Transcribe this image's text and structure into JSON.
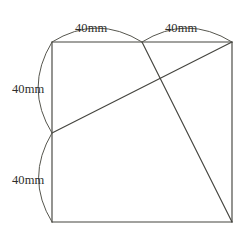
{
  "figure": {
    "type": "geometry-diagram",
    "canvas": {
      "width": 248,
      "height": 238
    },
    "colors": {
      "background": "#ffffff",
      "stroke": "#45453f",
      "arc_stroke": "#56564e",
      "label_text": "#2d2d2b"
    },
    "vertices": {
      "top_left": {
        "x": 52,
        "y": 42
      },
      "top_mid": {
        "x": 142,
        "y": 42
      },
      "top_right": {
        "x": 232,
        "y": 42
      },
      "left_mid": {
        "x": 52,
        "y": 133
      },
      "bottom_left": {
        "x": 52,
        "y": 222
      },
      "bottom_right": {
        "x": 232,
        "y": 222
      }
    },
    "outline": [
      {
        "name": "top-edge",
        "from": "top_left",
        "to": "top_right"
      },
      {
        "name": "right-edge",
        "from": "top_right",
        "to": "bottom_right"
      },
      {
        "name": "bottom-edge",
        "from": "bottom_right",
        "to": "bottom_left"
      },
      {
        "name": "left-edge",
        "from": "bottom_left",
        "to": "top_left"
      }
    ],
    "diagonals": [
      {
        "name": "diagonal-left-mid-to-top-right",
        "from": "left_mid",
        "to": "top_right"
      },
      {
        "name": "diagonal-top-mid-to-bottom-right",
        "from": "top_mid",
        "to": "bottom_right"
      }
    ],
    "dimensions": [
      {
        "id": "top-left-segment",
        "label": "40mm",
        "measures": "top edge left half",
        "label_x": 75,
        "label_y": 22,
        "arc": {
          "x1": 52,
          "y1": 42,
          "x2": 142,
          "y2": 42,
          "bulge": "up"
        }
      },
      {
        "id": "top-right-segment",
        "label": "40mm",
        "measures": "top edge right half",
        "label_x": 165,
        "label_y": 22,
        "arc": {
          "x1": 142,
          "y1": 42,
          "x2": 232,
          "y2": 42,
          "bulge": "up"
        }
      },
      {
        "id": "left-upper-segment",
        "label": "40mm",
        "measures": "left edge upper half",
        "label_x": 12,
        "label_y": 83,
        "arc": {
          "x1": 52,
          "y1": 42,
          "x2": 52,
          "y2": 133,
          "bulge": "left"
        }
      },
      {
        "id": "left-lower-segment",
        "label": "40mm",
        "measures": "left edge lower half",
        "label_x": 12,
        "label_y": 174,
        "arc": {
          "x1": 52,
          "y1": 133,
          "x2": 52,
          "y2": 222,
          "bulge": "left"
        }
      }
    ]
  }
}
